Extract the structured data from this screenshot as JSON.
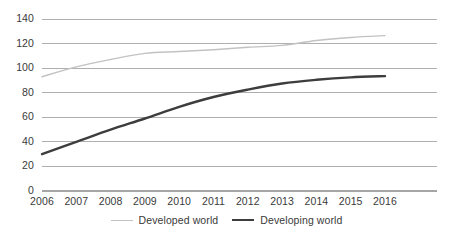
{
  "chart_data": {
    "type": "line",
    "title": "",
    "subtitle": "",
    "xlabel": "",
    "ylabel": "",
    "categories": [
      "2006",
      "2007",
      "2008",
      "2009",
      "2010",
      "2011",
      "2012",
      "2013",
      "2014",
      "2015",
      "2016"
    ],
    "x": [
      2006,
      2007,
      2008,
      2009,
      2010,
      2011,
      2012,
      2013,
      2014,
      2015,
      2016
    ],
    "series": [
      {
        "name": "Developed world",
        "color": "#c2c2c2",
        "values": [
          93,
          101,
          107,
          112,
          113.5,
          115,
          117,
          118.5,
          122.5,
          125,
          126.5
        ]
      },
      {
        "name": "Developing world",
        "color": "#3d3d3d",
        "values": [
          30,
          40,
          50,
          59,
          68.5,
          76.5,
          82.5,
          87.5,
          90.5,
          92.5,
          93.5
        ]
      }
    ],
    "ylim": [
      0,
      140
    ],
    "yticks": [
      0,
      20,
      40,
      60,
      80,
      100,
      120,
      140
    ],
    "ytick_labels": [
      "0",
      "20",
      "40",
      "60",
      "80",
      "100",
      "120",
      "140"
    ],
    "xlim": [
      2006,
      2016
    ],
    "grid": true,
    "grid_axis": "y",
    "grid_color": "#a6a6a6",
    "legend_position": "bottom",
    "legend": [
      "Developed world",
      "Developing world"
    ]
  },
  "legend": {
    "items": [
      {
        "label": "Developed world"
      },
      {
        "label": "Developing world"
      }
    ]
  }
}
